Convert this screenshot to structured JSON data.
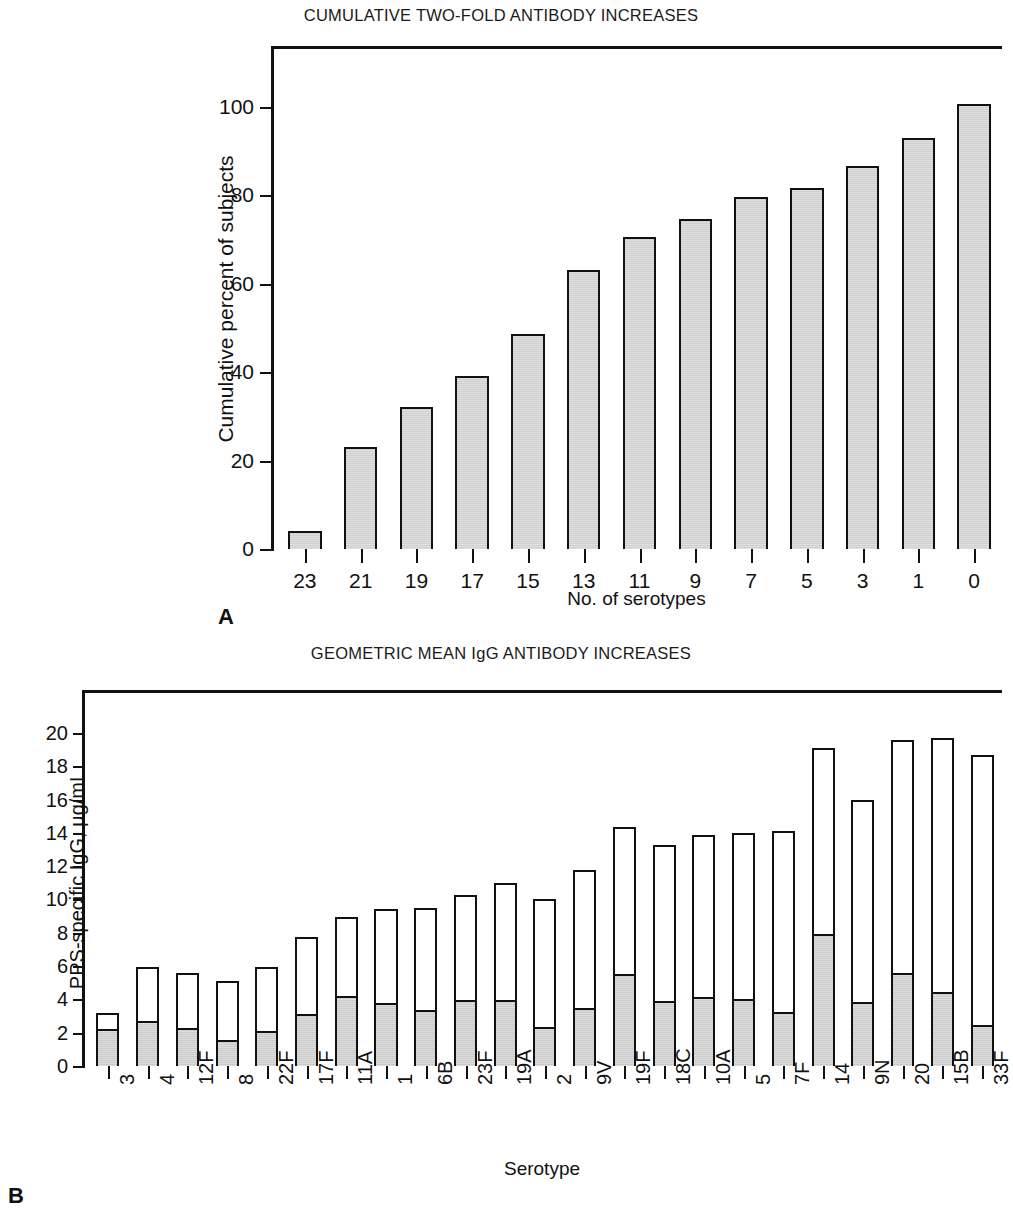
{
  "figure": {
    "panel_a_letter": "A",
    "panel_b_letter": "B"
  },
  "chart_data": [
    {
      "type": "bar",
      "panel": "A",
      "title": "CUMULATIVE TWO-FOLD ANTIBODY INCREASES",
      "xlabel": "No. of serotypes",
      "ylabel": "Cumulative percent of subjects",
      "categories": [
        "23",
        "21",
        "19",
        "17",
        "15",
        "13",
        "11",
        "9",
        "7",
        "5",
        "3",
        "1",
        "0"
      ],
      "values": [
        4,
        23,
        32,
        39,
        48.5,
        63,
        70.5,
        74.5,
        79.5,
        81.5,
        86.5,
        93,
        100.5
      ],
      "xticks": [
        "23",
        "21",
        "19",
        "17",
        "15",
        "13",
        "11",
        "9",
        "7",
        "5",
        "3",
        "1",
        "0"
      ],
      "yticks": [
        0,
        20,
        40,
        60,
        80,
        100
      ],
      "ytick_labels": [
        "0",
        "20",
        "40",
        "60",
        "80",
        "100"
      ],
      "ylim": [
        0,
        113
      ],
      "grid": false,
      "legend": "none",
      "bar_fill": "#cfcfcf",
      "bar_edge": "#111111"
    },
    {
      "type": "bar",
      "panel": "B",
      "title": "GEOMETRIC MEAN IgG ANTIBODY INCREASES",
      "xlabel": "Serotype",
      "ylabel": "PPS-specific IgG, µg/mL",
      "categories": [
        "3",
        "4",
        "12F",
        "8",
        "22F",
        "17F",
        "11A",
        "1",
        "6B",
        "23F",
        "19A",
        "2",
        "9V",
        "19F",
        "18C",
        "10A",
        "5",
        "7F",
        "14",
        "9N",
        "20",
        "15B",
        "33F"
      ],
      "series": [
        {
          "name": "prevaccination (shaded)",
          "values": [
            2.3,
            2.75,
            2.35,
            1.6,
            2.15,
            3.2,
            4.25,
            3.85,
            3.4,
            4.0,
            4.0,
            2.4,
            3.5,
            5.55,
            3.95,
            4.2,
            4.05,
            3.3,
            8.0,
            3.85,
            5.65,
            4.5,
            2.45
          ]
        },
        {
          "name": "postvaccination total (open)",
          "values": [
            3.2,
            5.95,
            5.6,
            5.1,
            5.95,
            7.75,
            8.95,
            9.4,
            9.5,
            10.3,
            11.0,
            10.05,
            11.75,
            14.35,
            13.25,
            13.9,
            14.0,
            14.1,
            19.1,
            16.0,
            19.55,
            19.7,
            18.65
          ]
        }
      ],
      "yticks": [
        0,
        2,
        4,
        6,
        8,
        10,
        12,
        14,
        16,
        18,
        20
      ],
      "ytick_labels": [
        "0",
        "2",
        "4",
        "6",
        "8",
        "10",
        "12",
        "14",
        "16",
        "18",
        "20"
      ],
      "ylim": [
        0,
        22.4
      ],
      "grid": false,
      "legend": "none",
      "bar_fill_lower": "#cbcbcb",
      "bar_fill_upper": "#ffffff",
      "bar_edge": "#111111"
    }
  ]
}
